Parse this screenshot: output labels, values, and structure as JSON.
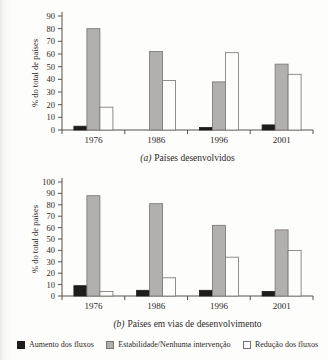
{
  "page": {
    "background": "#fdfdfc",
    "text_color": "#2b2926",
    "axis_color": "#55524e"
  },
  "series_styles": [
    {
      "name": "Aumento dos fluxos",
      "fill": "#1f1d1b",
      "stroke": "#1f1d1b"
    },
    {
      "name": "Estabilidade/Nenhuma intervenção",
      "fill": "#b2b0ac",
      "stroke": "#76736e"
    },
    {
      "name": "Redução dos fluxos",
      "fill": "#fdfdfc",
      "stroke": "#76736e"
    }
  ],
  "legend": {
    "items": [
      {
        "label": "Aumento dos fluxos",
        "swatch": "black-filled-square",
        "color": "#1f1d1b"
      },
      {
        "label": "Estabilidade/Nenhuma intervenção",
        "swatch": "gray-filled-square",
        "color": "#b2b0ac"
      },
      {
        "label": "Redução dos fluxos",
        "swatch": "white-outlined-square",
        "color": "#fdfdfc"
      }
    ]
  },
  "chart_data": [
    {
      "type": "bar",
      "title": "(a) Países desenvolvidos",
      "caption_prefix": "(a)",
      "caption_text": "Países desenvolvidos",
      "xlabel": "",
      "ylabel": "% do total de países",
      "ylim": [
        0,
        90
      ],
      "ytick_step": 10,
      "grid": false,
      "legend_position": "shared-bottom",
      "categories": [
        "1976",
        "1986",
        "1996",
        "2001"
      ],
      "series": [
        {
          "name": "Aumento dos fluxos",
          "values": [
            3,
            0,
            2,
            4
          ]
        },
        {
          "name": "Estabilidade/Nenhuma intervenção",
          "values": [
            80,
            62,
            38,
            52
          ]
        },
        {
          "name": "Redução dos fluxos",
          "values": [
            18,
            39,
            61,
            44
          ]
        }
      ]
    },
    {
      "type": "bar",
      "title": "(b) Países em vias de desenvolvimento",
      "caption_prefix": "(b)",
      "caption_text": "Países em vias de desenvolvimento",
      "xlabel": "",
      "ylabel": "% do total de países",
      "ylim": [
        0,
        100
      ],
      "ytick_step": 10,
      "grid": false,
      "legend_position": "shared-bottom",
      "categories": [
        "1976",
        "1986",
        "1996",
        "2001"
      ],
      "series": [
        {
          "name": "Aumento dos fluxos",
          "values": [
            9,
            5,
            5,
            4
          ]
        },
        {
          "name": "Estabilidade/Nenhuma intervenção",
          "values": [
            88,
            81,
            62,
            58
          ]
        },
        {
          "name": "Redução dos fluxos",
          "values": [
            4,
            16,
            34,
            40
          ]
        }
      ]
    }
  ]
}
